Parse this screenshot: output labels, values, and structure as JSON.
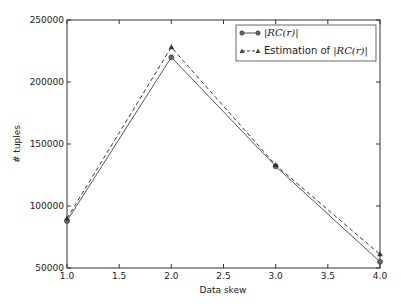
{
  "chart_data": {
    "type": "line",
    "title": "",
    "xlabel": "Data skew",
    "ylabel": "# tuples",
    "x": [
      1.0,
      2.0,
      3.0,
      4.0
    ],
    "xlim": [
      1.0,
      4.0
    ],
    "ylim": [
      50000,
      250000
    ],
    "xticks": [
      "1.0",
      "1.5",
      "2.0",
      "2.5",
      "3.0",
      "3.5",
      "4.0"
    ],
    "yticks": [
      "50000",
      "100000",
      "150000",
      "200000",
      "250000"
    ],
    "grid": false,
    "legend_position": "upper right",
    "series": [
      {
        "name": "|RC(r)|",
        "values": [
          88000,
          220000,
          132000,
          55000
        ],
        "marker": "circle",
        "linestyle": "solid",
        "color": "#555555"
      },
      {
        "name": "Estimation of |RC(r)|",
        "values": [
          90000,
          228000,
          133000,
          61000
        ],
        "marker": "triangle",
        "linestyle": "dashed",
        "color": "#333333"
      }
    ]
  },
  "legend": {
    "item1": "|RC(r)|",
    "item2_prefix": "Estimation of ",
    "item2_math": "|RC(r)|"
  }
}
